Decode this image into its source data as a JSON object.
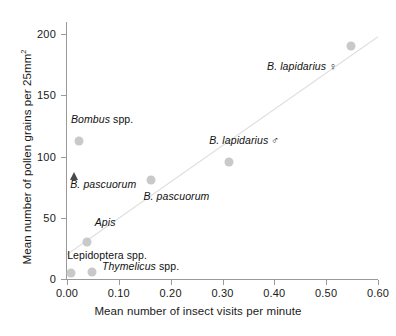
{
  "chart_data": {
    "type": "scatter",
    "title": "",
    "xlabel": "Mean number of insect visits per minute",
    "ylabel": "Mean number of pollen grains per 25mm",
    "ylabel_sup": "2",
    "xlim": [
      0.0,
      0.6
    ],
    "ylim": [
      0,
      210
    ],
    "xticks": [
      "0.00",
      "0.10",
      "0.20",
      "0.30",
      "0.40",
      "0.50",
      "0.60"
    ],
    "xtick_values": [
      0.0,
      0.1,
      0.2,
      0.3,
      0.4,
      0.5,
      0.6
    ],
    "yticks": [
      "0",
      "50",
      "100",
      "150",
      "200"
    ],
    "ytick_values": [
      0,
      50,
      100,
      150,
      200
    ],
    "grid": false,
    "legend": "none",
    "marker_color": "#c9c9c9",
    "triangle_color": "#4a4a4a",
    "trendline_color": "#e0e0e0",
    "axis_color": "#9a9a9a",
    "trendline": {
      "x0": 0.0,
      "y0": 20,
      "x1": 0.6,
      "y1": 198
    },
    "points": [
      {
        "label": "Lepidoptera spp.",
        "x": 0.008,
        "y": 5,
        "marker": "circle",
        "label_italic": false,
        "label_dx": -4,
        "label_dy": -18,
        "label_align": "left"
      },
      {
        "label": "Thymelicus spp.",
        "x": 0.048,
        "y": 6,
        "marker": "circle",
        "label_italic": true,
        "label_dx": 10,
        "label_dy": -6,
        "label_align": "left"
      },
      {
        "label": "Apis",
        "x": 0.038,
        "y": 30,
        "marker": "circle",
        "label_italic": true,
        "label_dx": 8,
        "label_dy": -20,
        "label_align": "left"
      },
      {
        "label": "B. pascuorum",
        "x": 0.014,
        "y": 84,
        "marker": "triangle",
        "label_italic": true,
        "label_dx": -4,
        "label_dy": 8,
        "label_align": "left"
      },
      {
        "label": "Bombus spp.",
        "x": 0.023,
        "y": 113,
        "marker": "circle",
        "label_italic": true,
        "label_dx": -8,
        "label_dy": -22,
        "label_align": "left"
      },
      {
        "label": "B. pascuorum",
        "x": 0.163,
        "y": 81,
        "marker": "circle",
        "label_italic": true,
        "label_dx": -8,
        "label_dy": 16,
        "label_align": "left"
      },
      {
        "label": "B. lapidarius ♂",
        "x": 0.313,
        "y": 96,
        "marker": "circle",
        "label_italic": true,
        "label_dx": -20,
        "label_dy": -22,
        "label_align": "left"
      },
      {
        "label": "B. lapidarius ♀",
        "x": 0.548,
        "y": 190,
        "marker": "circle",
        "label_italic": true,
        "label_dx": -84,
        "label_dy": 20,
        "label_align": "left"
      }
    ]
  }
}
